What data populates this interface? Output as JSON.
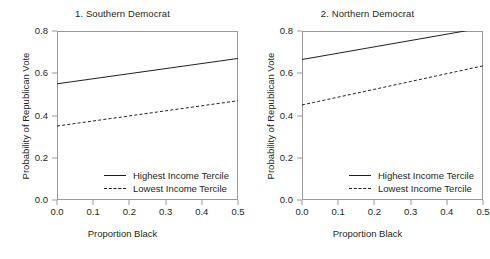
{
  "figure": {
    "background": "#ffffff",
    "line_color": "#231f20",
    "axis_color": "#9a9a9a"
  },
  "chart_data": [
    {
      "type": "line",
      "title": "1. Southern Democrat",
      "xlabel": "Proportion Black",
      "ylabel": "Probability of Republican Vote",
      "xlim": [
        0.0,
        0.5
      ],
      "ylim": [
        0.0,
        0.8
      ],
      "xticks": [
        "0.0",
        "0.1",
        "0.2",
        "0.3",
        "0.4",
        "0.5"
      ],
      "xtick_values": [
        0.0,
        0.1,
        0.2,
        0.3,
        0.4,
        0.5
      ],
      "yticks": [
        "0.0",
        "0.2",
        "0.4",
        "0.6",
        "0.8"
      ],
      "ytick_values": [
        0.0,
        0.2,
        0.4,
        0.6,
        0.8
      ],
      "grid": false,
      "legend_position": "inside lower right",
      "x": [
        0.0,
        0.5
      ],
      "series": [
        {
          "name": "Highest Income Tercile",
          "style": "solid",
          "values": [
            0.55,
            0.67
          ]
        },
        {
          "name": "Lowest Income Tercile",
          "style": "dashed",
          "values": [
            0.35,
            0.47
          ]
        }
      ]
    },
    {
      "type": "line",
      "title": "2. Northern Democrat",
      "xlabel": "Proportion Black",
      "ylabel": "Probability of Republican Vote",
      "xlim": [
        0.0,
        0.5
      ],
      "ylim": [
        0.0,
        0.8
      ],
      "xticks": [
        "0.0",
        "0.1",
        "0.2",
        "0.3",
        "0.4",
        "0.5"
      ],
      "xtick_values": [
        0.0,
        0.1,
        0.2,
        0.3,
        0.4,
        0.5
      ],
      "yticks": [
        "0.0",
        "0.2",
        "0.4",
        "0.6",
        "0.8"
      ],
      "ytick_values": [
        0.0,
        0.2,
        0.4,
        0.6,
        0.8
      ],
      "grid": false,
      "legend_position": "inside lower right",
      "x": [
        0.0,
        0.5
      ],
      "series": [
        {
          "name": "Highest Income Tercile",
          "style": "solid",
          "values": [
            0.665,
            0.815
          ]
        },
        {
          "name": "Lowest Income Tercile",
          "style": "dashed",
          "values": [
            0.45,
            0.635
          ]
        }
      ]
    }
  ]
}
